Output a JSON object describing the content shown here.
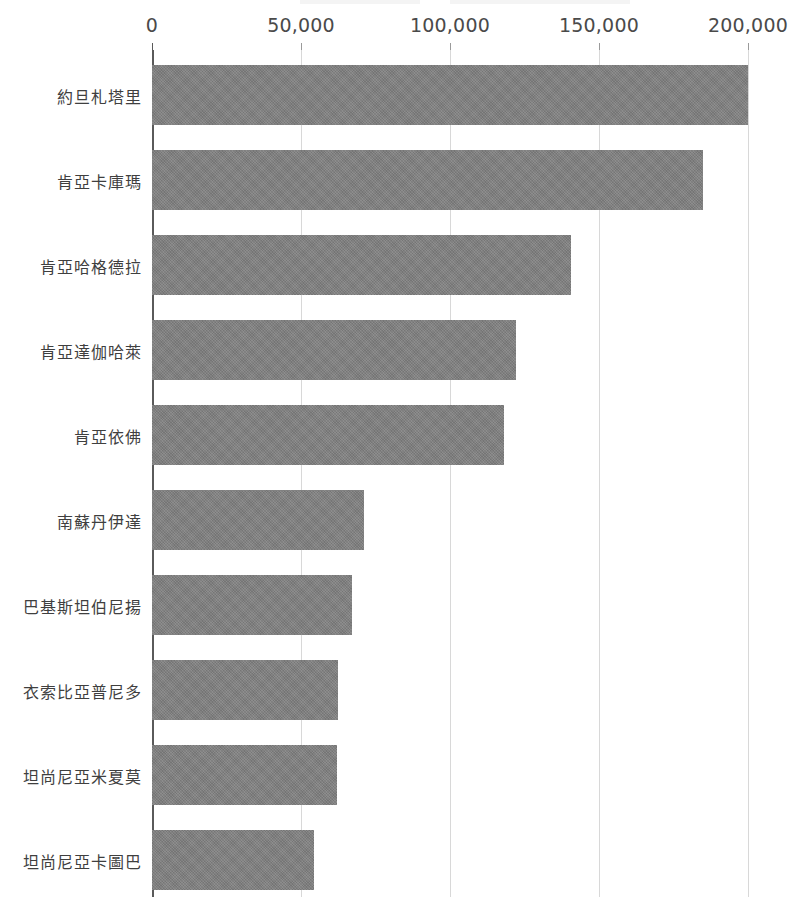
{
  "chart_data": {
    "type": "bar",
    "orientation": "horizontal",
    "title": "",
    "subtitle": "",
    "xlabel": "",
    "ylabel": "",
    "xlim": [
      0,
      200000
    ],
    "grid": true,
    "legend": false,
    "legend_position": "none",
    "bar_color": "#808080",
    "gridline_color": "#d8d8d8",
    "axis_color": "#5a5a5a",
    "text_color": "#3f3f3f",
    "xticks": [
      0,
      50000,
      100000,
      150000,
      200000
    ],
    "xtick_labels": [
      "0",
      "50,000",
      "100,000",
      "150,000",
      "200,000"
    ],
    "categories": [
      "約旦札塔里",
      "肯亞卡庫瑪",
      "肯亞哈格德拉",
      "肯亞達伽哈萊",
      "肯亞依佛",
      "南蘇丹伊達",
      "巴基斯坦伯尼揚",
      "衣索比亞普尼多",
      "坦尚尼亞米夏莫",
      "坦尚尼亞卡圖巴"
    ],
    "values": [
      200000,
      185000,
      140500,
      122000,
      118000,
      71000,
      67000,
      62500,
      62000,
      54500
    ]
  }
}
